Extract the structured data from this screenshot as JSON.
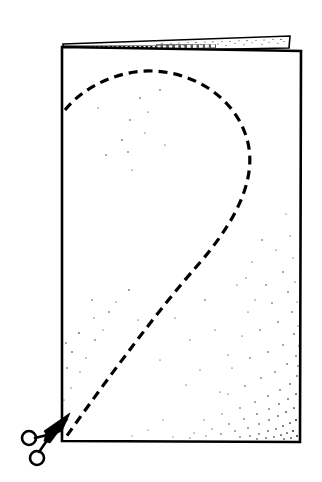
{
  "figure": {
    "caption": "",
    "background_color": "#ffffff",
    "ink_color": "#000000",
    "style": "black-and-white line art with stipple shading",
    "canvas": {
      "width": 322,
      "height": 482
    }
  },
  "elements": {
    "front_panel": {
      "name": "front panel of folded paper",
      "corners": [
        {
          "x": 62,
          "y": 47
        },
        {
          "x": 301,
          "y": 51
        },
        {
          "x": 300,
          "y": 442
        },
        {
          "x": 62,
          "y": 441
        }
      ],
      "fill": "#ffffff",
      "stroke_width": 2.6
    },
    "back_flap": {
      "name": "folded back flap at top",
      "corners": [
        {
          "x": 63,
          "y": 44
        },
        {
          "x": 290,
          "y": 36
        },
        {
          "x": 289,
          "y": 48
        },
        {
          "x": 64,
          "y": 52
        }
      ],
      "fill": "#ffffff",
      "texture": "dense stipple, darkest at the left end",
      "stroke_width": 1.6
    },
    "fold_edge": {
      "name": "folded top edge",
      "from": {
        "x": 63,
        "y": 49
      },
      "to": {
        "x": 289,
        "y": 46
      },
      "shading": "near-solid black with white speckles on the left half"
    },
    "cut_line": {
      "name": "dashed cutting line",
      "style": "dashed",
      "dash_pattern": "9 6",
      "stroke_width": 3.2,
      "start": {
        "x": 65,
        "y": 110
      },
      "apex": {
        "x": 163,
        "y": 72
      },
      "rightmost": {
        "x": 249,
        "y": 152
      },
      "end": {
        "x": 65,
        "y": 438
      },
      "description": "teardrop sweep from left edge, over the top, around the right, back down to the bottom-left corner"
    },
    "scissors": {
      "name": "scissors cutting at bottom-left corner",
      "pivot": {
        "x": 47,
        "y": 434
      },
      "blade_tip": {
        "x": 70,
        "y": 414
      },
      "upper_ring": {
        "cx": 29,
        "cy": 438,
        "r": 7
      },
      "lower_ring": {
        "cx": 37,
        "cy": 458,
        "r": 7
      },
      "orientation": "blades pointing up and to the right along the cut line"
    },
    "shading": {
      "name": "stipple shading",
      "regions": [
        {
          "area": "bottom-right corner",
          "density": "dense, fading up and left"
        },
        {
          "area": "lower-left of panel",
          "density": "sparse"
        },
        {
          "area": "upper-middle of panel",
          "density": "very sparse"
        }
      ]
    }
  }
}
